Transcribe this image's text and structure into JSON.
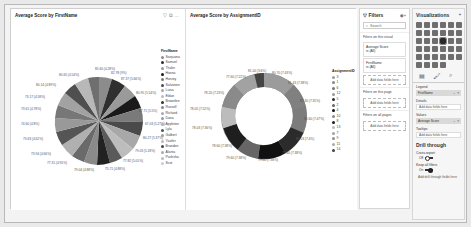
{
  "visuals": {
    "pie": {
      "title": "Average Score by FirstName",
      "legend_title": "FirstName",
      "legend": [
        "Sanjuana",
        "Samuel",
        "Thaler",
        "Hanna",
        "Harvey",
        "Salvatore",
        "Luisa",
        "Eldan",
        "Brownlee",
        "Russell",
        "Richard",
        "Dana",
        "Appleton",
        "Lyla",
        "Galbert",
        "Yasifer",
        "Brandon",
        "Alanta",
        "Pashsha",
        "Scot"
      ],
      "labels": [
        "85.60 (4.28%)",
        "82.78 (9%)",
        "87.37 (5.66%)",
        "80.95 (5.54%)",
        "87.71 (5.5%)",
        "67.03 (5.27%)",
        "80.27 (5.37%)",
        "79.03 (5.18%)",
        "77.82 (5.01%)",
        "75.71 (4.88%)",
        "79.04 (4.88%)",
        "77.31 (4.95%)",
        "73.94 (4.66%)",
        "73.63 (4.62%)",
        "74.60 (4.8%)",
        "73.61 (4.78%)",
        "73.17 (4.58%)",
        "80.14 (4.89%)",
        "80.65 (4.54%)"
      ]
    },
    "donut": {
      "title": "Average Score by AssignmentID",
      "legend_title": "AssignmentID",
      "legend": [
        "3",
        "1",
        "6",
        "12",
        "5",
        "2",
        "4",
        "10",
        "8",
        "13",
        "7",
        "9",
        "11",
        "14"
      ],
      "labels": [
        "81.00 (3.6%)",
        "80.70 (7.43%)",
        "81.43 (7.38%)",
        "81.30 (7.35%)",
        "80.60 (7.47%)",
        "80.03 (7.4%)",
        "79.60 (7.38%)",
        "79.60 (7.38%)",
        "79.60 (7.38%)",
        "78.60 (7.38%)",
        "78.03 (7.36%)",
        "78.05 (7.52%)",
        "78.20 (7.23%)",
        "77.60 (7.22%)"
      ]
    }
  },
  "filters": {
    "title": "Filters",
    "search_placeholder": "Search",
    "on_visual": "Filters on this visual",
    "cards": [
      {
        "field": "Average Score",
        "value": "is (All)"
      },
      {
        "field": "FirstName",
        "value": "is (All)"
      }
    ],
    "add_label": "Add data fields here",
    "on_page": "Filters on this page",
    "on_all": "Filters on all pages"
  },
  "visualizations": {
    "title": "Visualizations",
    "wells": {
      "legend": "Legend",
      "legend_field": "FirstName",
      "details": "Details",
      "values": "Values",
      "values_field": "Average Score",
      "tooltips": "Tooltips",
      "add": "Add data fields here"
    },
    "drill_title": "Drill through",
    "cross_report": "Cross-report",
    "cross_state": "Off",
    "keep_filters": "Keep all filters",
    "keep_state": "On",
    "drill_add": "Add drill-through fields here"
  }
}
